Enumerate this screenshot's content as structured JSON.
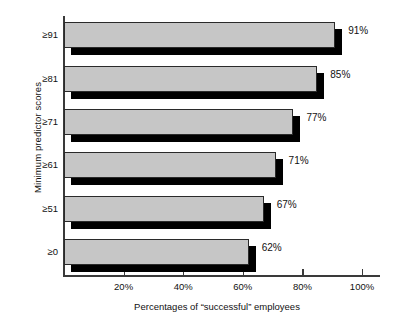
{
  "chart_data": {
    "type": "bar",
    "orientation": "horizontal",
    "title": "",
    "xlabel": "Percentages of “successful” employees",
    "ylabel": "Minimum predictor scores",
    "categories": [
      "≥91",
      "≥81",
      "≥71",
      "≥61",
      "≥51",
      "≥0"
    ],
    "values": [
      91,
      85,
      77,
      71,
      67,
      62
    ],
    "value_labels": [
      "91%",
      "85%",
      "77%",
      "71%",
      "67%",
      "62%"
    ],
    "xlim": [
      0,
      106
    ],
    "xticks": [
      20,
      40,
      60,
      80,
      100
    ],
    "xtick_labels": [
      "20%",
      "40%",
      "60%",
      "80%",
      "100%"
    ],
    "grid": false,
    "legend": "none",
    "series": [
      {
        "name": "Percentage successful",
        "values": [
          91,
          85,
          77,
          71,
          67,
          62
        ]
      }
    ],
    "style": {
      "bar_fill": "#c6c6c6",
      "bar_edge": "#2a2a2a",
      "bar_shadow": "#000000",
      "axis_color": "#3a3a3a",
      "background": "#ffffff"
    }
  }
}
